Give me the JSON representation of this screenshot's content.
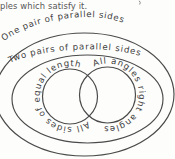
{
  "page": {
    "background": "#fdfdfc",
    "truncated_sentence": "ples which satisfy it."
  },
  "diagram": {
    "type": "euler-venn-quadrilaterals",
    "stroke_color": "#4a4a4a",
    "label_color": "#404040",
    "sentence_color": "#565656",
    "labels": {
      "outer_ellipse": "One pair of parallel sides",
      "inner_ellipse": "Two pairs of parallel sides",
      "left_circle": "All sides of equal length",
      "right_circle": "All angles right angles"
    }
  }
}
